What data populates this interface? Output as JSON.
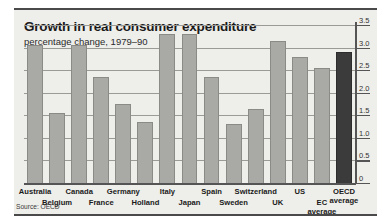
{
  "chart_data": {
    "type": "bar",
    "title": "Growth in real consumer expenditure",
    "subtitle": "percentage change, 1979–90",
    "source": "Source: OECD",
    "xlabel": "",
    "ylabel": "",
    "ylim": [
      0,
      3.5
    ],
    "grid": true,
    "legend": "none",
    "yticks": [
      "0",
      "0.5",
      "1.0",
      "1.5",
      "2.0",
      "2.5",
      "3.0",
      "3.5"
    ],
    "ytick_values": [
      0,
      0.5,
      1.0,
      1.5,
      2.0,
      2.5,
      3.0,
      3.5
    ],
    "categories": [
      "Australia",
      "Belgium",
      "Canada",
      "France",
      "Germany",
      "Holland",
      "Italy",
      "Japan",
      "Spain",
      "Sweden",
      "Switzerland",
      "UK",
      "US",
      "EC average",
      "OECD average"
    ],
    "values": [
      3.05,
      1.55,
      3.05,
      2.35,
      1.75,
      1.35,
      3.3,
      3.3,
      2.35,
      1.3,
      1.65,
      3.15,
      2.8,
      2.55,
      2.9
    ],
    "highlight_index": 14,
    "colors": {
      "bar": "#a9a9a6",
      "bar_border": "#8a8a87",
      "bar_highlight": "#3b3b3b",
      "panel_background": "#eeeeea",
      "gridline": "#9a9a96",
      "axis": "#555555",
      "text": "#1a1a1a"
    }
  }
}
